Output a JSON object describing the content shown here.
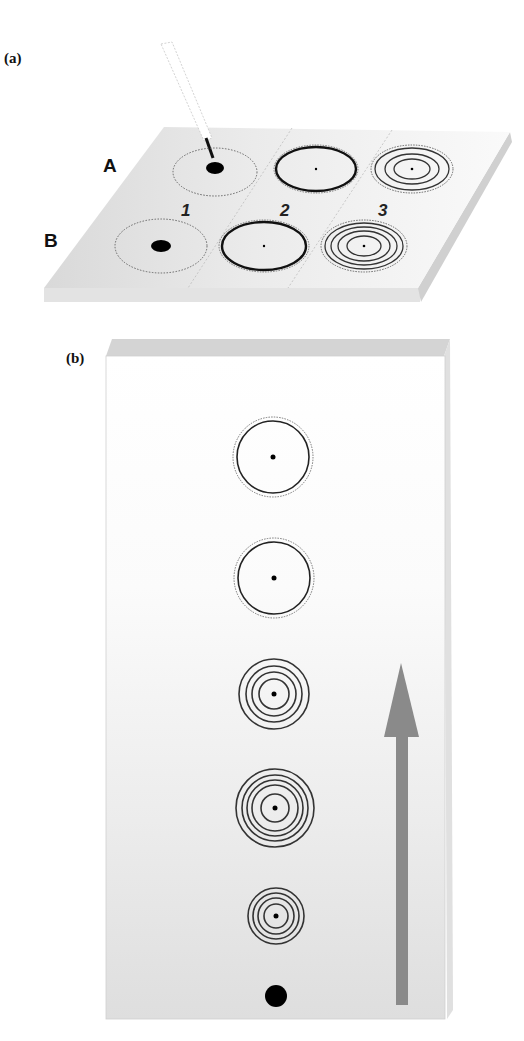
{
  "figure": {
    "panel_a": {
      "label": "(a)",
      "row_labels": [
        "A",
        "B"
      ],
      "column_labels": [
        "1",
        "2",
        "3"
      ],
      "elements": {
        "pipette": "capillary-pipette-applying-sample",
        "plate": "tlc-plate-perspective",
        "spots": [
          {
            "row": "A",
            "col": "1",
            "type": "filled-spot-with-dotted-ring"
          },
          {
            "row": "A",
            "col": "2",
            "type": "thick-ring-with-center-dot"
          },
          {
            "row": "A",
            "col": "3",
            "type": "concentric-rings-3"
          },
          {
            "row": "B",
            "col": "1",
            "type": "filled-spot-with-dotted-ring"
          },
          {
            "row": "B",
            "col": "2",
            "type": "thick-ring-with-center-dot"
          },
          {
            "row": "B",
            "col": "3",
            "type": "concentric-rings-4"
          }
        ]
      }
    },
    "panel_b": {
      "label": "(b)",
      "elements": {
        "plate": "tlc-plate-vertical",
        "arrow": "solvent-direction-arrow-up",
        "arrow_color": "#8a8a8a",
        "spots_top_to_bottom": [
          {
            "type": "single-ring-with-dotted-outer",
            "rings": 1
          },
          {
            "type": "single-ring-with-dotted-outer",
            "rings": 1
          },
          {
            "type": "concentric-rings",
            "rings": 4
          },
          {
            "type": "concentric-rings",
            "rings": 5
          },
          {
            "type": "concentric-rings",
            "rings": 4
          },
          {
            "type": "origin-spot-filled",
            "rings": 0
          }
        ]
      }
    }
  }
}
